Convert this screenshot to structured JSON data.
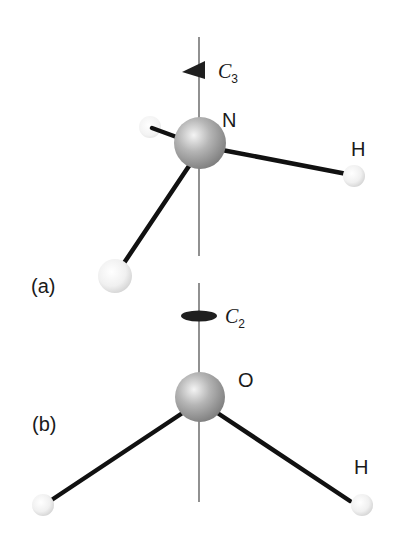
{
  "figure": {
    "panel_a": {
      "label": "(a)",
      "molecule": "NH3",
      "central_atom": "N",
      "hydrogen_label": "H",
      "axis": {
        "symbol": "C",
        "order": "3",
        "marker": "triangle"
      }
    },
    "panel_b": {
      "label": "(b)",
      "molecule": "H2O",
      "central_atom": "O",
      "hydrogen_label": "H",
      "axis": {
        "symbol": "C",
        "order": "2",
        "marker": "ellipse"
      }
    },
    "colors": {
      "axis_line": "#555555",
      "bond": "#111111",
      "marker": "#222222",
      "heavy_atom": "#9a9a9a",
      "hydrogen": "#eeeeee"
    }
  }
}
